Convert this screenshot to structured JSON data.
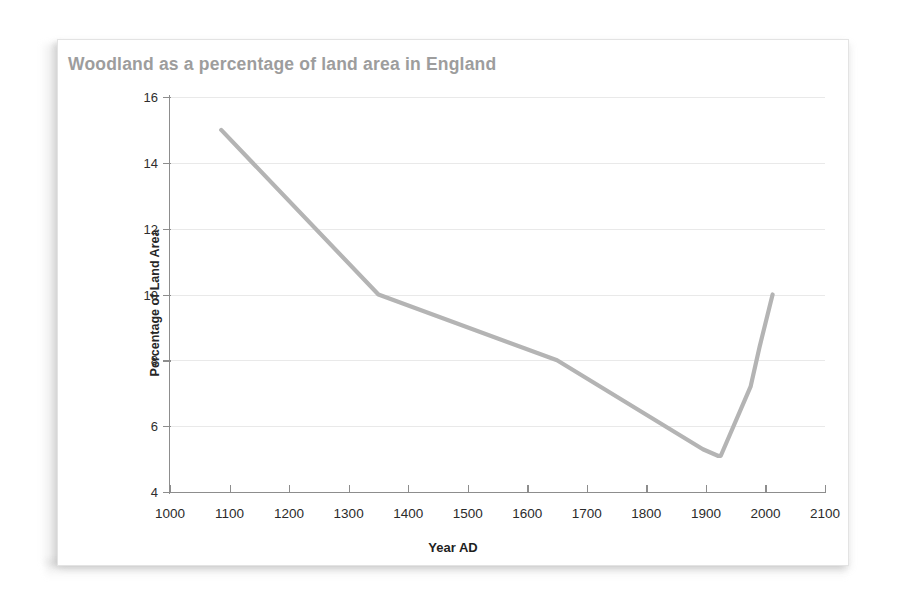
{
  "chart_data": {
    "type": "line",
    "title": "Woodland as a percentage of land area in England",
    "xlabel": "Year AD",
    "ylabel": "Percentage of Land Area",
    "xlim": [
      1000,
      2100
    ],
    "ylim": [
      4,
      16
    ],
    "xticks": [
      1000,
      1100,
      1200,
      1300,
      1400,
      1500,
      1600,
      1700,
      1800,
      1900,
      2000,
      2100
    ],
    "yticks": [
      4,
      6,
      8,
      10,
      12,
      14,
      16
    ],
    "grid": "horizontal",
    "legend": "none",
    "line_color": "#b4b4b4",
    "series": [
      {
        "name": "Woodland cover",
        "x": [
          1086,
          1350,
          1650,
          1895,
          1920,
          1925,
          1975,
          1990,
          2012
        ],
        "y": [
          15.0,
          10.0,
          8.0,
          5.3,
          5.1,
          5.1,
          7.2,
          8.4,
          10.0
        ]
      }
    ]
  },
  "card": {
    "title": "Woodland as a percentage of land area in England",
    "title_color": "#9d9d9d"
  },
  "axes": {
    "x_label": "Year AD",
    "y_label": "Percentage of Land Area",
    "x_tick_labels": [
      "1000",
      "1100",
      "1200",
      "1300",
      "1400",
      "1500",
      "1600",
      "1700",
      "1800",
      "1900",
      "2000",
      "2100"
    ],
    "y_tick_labels": [
      "4",
      "6",
      "8",
      "10",
      "12",
      "14",
      "16"
    ]
  }
}
